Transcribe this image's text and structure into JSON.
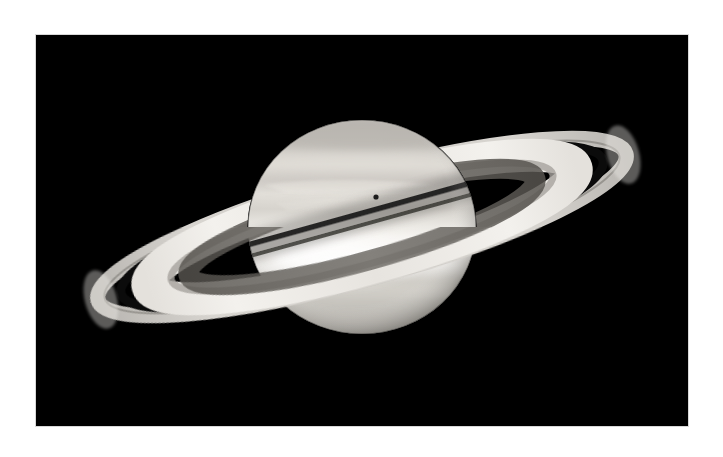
{
  "page": {
    "background_color": "#ffffff",
    "width": 723,
    "height": 457
  },
  "photo": {
    "alt_text": "Saturn and its rings photographed against black space",
    "subject": "Saturn",
    "background_color": "#000000",
    "frame": {
      "x": 36,
      "y": 35,
      "width": 652,
      "height": 391
    },
    "border_color": "#d8d8d8",
    "palette": {
      "space_black": "#000000",
      "globe_bright": "#f2f0ec",
      "globe_mid": "#cfccc6",
      "globe_dark": "#a9a69f",
      "globe_limb": "#6e6b66",
      "ring_bright": "#e9e7e2",
      "ring_mid": "#b9b6b0",
      "ring_faint": "#6d6a66",
      "cassini_division": "#141414",
      "ring_shadow": "#2b2a28",
      "moon_dot": "#1b1b1b"
    }
  },
  "scene": {
    "globe": {
      "name": "saturn-globe",
      "center_x": 326,
      "center_y": 192,
      "radius_x": 114,
      "radius_y": 107,
      "bands": [
        {
          "label": "north polar haze",
          "cy": 95,
          "height": 34,
          "tone": "#b9b6b0"
        },
        {
          "label": "north temperate belt",
          "cy": 128,
          "height": 18,
          "tone": "#cbc8c2"
        },
        {
          "label": "north tropical zone",
          "cy": 148,
          "height": 14,
          "tone": "#ddd9d3"
        },
        {
          "label": "equatorial bright zone",
          "cy": 214,
          "height": 32,
          "tone": "#f4f2ee"
        },
        {
          "label": "south tropical band",
          "cy": 246,
          "height": 20,
          "tone": "#d7d3cd"
        },
        {
          "label": "south temperate belt",
          "cy": 268,
          "height": 18,
          "tone": "#c5c1bb"
        },
        {
          "label": "south polar region",
          "cy": 296,
          "height": 28,
          "tone": "#b2afa9"
        }
      ]
    },
    "rings": {
      "name": "saturn-rings",
      "center_x": 326,
      "center_y": 192,
      "tilt_degrees": -15.5,
      "components": [
        {
          "id": "a-ring-outer",
          "rx": 274,
          "ry": 52,
          "tone": "#d6d3ce",
          "thickness": 15
        },
        {
          "id": "encke-gap",
          "rx": 252,
          "ry": 48,
          "tone": "#6f6c68",
          "thickness": 3
        },
        {
          "id": "cassini-division",
          "rx": 236,
          "ry": 45,
          "tone": "#0d0d0d",
          "thickness": 9
        },
        {
          "id": "b-ring",
          "rx": 212,
          "ry": 40,
          "tone": "#edebe6",
          "thickness": 30
        },
        {
          "id": "c-ring",
          "rx": 166,
          "ry": 31,
          "tone": "#5f5c58",
          "thickness": 16
        }
      ]
    },
    "ring_shadow": {
      "name": "ring-shadow-on-globe",
      "description": "dark ring shadow band crossing the planet's northern hemisphere",
      "tone": "#3a3835"
    },
    "moon_dot": {
      "name": "moon-shadow-dot",
      "x": 340,
      "y": 162,
      "radius": 2.6,
      "tone": "#1d1d1d"
    }
  }
}
